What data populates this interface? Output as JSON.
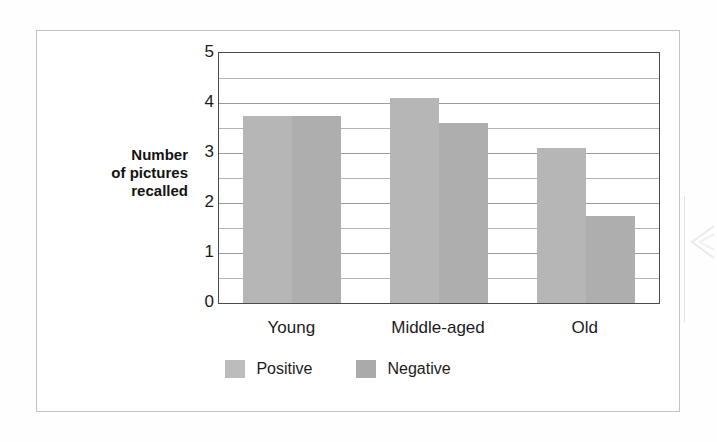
{
  "chart_data": {
    "type": "bar",
    "title": "",
    "subtitle": "",
    "xlabel": "",
    "ylabel": "Number of pictures recalled",
    "ylabel_lines": [
      "Number",
      "of pictures",
      "recalled"
    ],
    "categories": [
      "Young",
      "Middle-aged",
      "Old"
    ],
    "series": [
      {
        "name": "Positive",
        "color": "#b6b6b6",
        "values": [
          3.75,
          4.1,
          3.1
        ]
      },
      {
        "name": "Negative",
        "color": "#aeaeae",
        "values": [
          3.75,
          3.6,
          1.75
        ]
      }
    ],
    "ylim": [
      0,
      5
    ],
    "ytick_labels": [
      "0",
      "1",
      "2",
      "3",
      "4",
      "5"
    ],
    "ytick_values": [
      0,
      1,
      2,
      3,
      4,
      5
    ],
    "gridline_values": [
      0.5,
      1,
      1.5,
      2,
      2.5,
      3,
      3.5,
      4,
      4.5
    ],
    "grid": true,
    "legend_position": "bottom",
    "legend_entries": [
      "Positive",
      "Negative"
    ]
  },
  "legend": {
    "positive_label": "Positive",
    "negative_label": "Negative"
  },
  "axis": {
    "y_label_line1": "Number",
    "y_label_line2": "of pictures",
    "y_label_line3": "recalled",
    "tick_5": "5",
    "tick_4": "4",
    "tick_3": "3",
    "tick_2": "2",
    "tick_1": "1",
    "tick_0": "0"
  },
  "categories": {
    "young": "Young",
    "middle_aged": "Middle-aged",
    "old": "Old"
  },
  "colors": {
    "positive_bar": "#b6b6b6",
    "negative_bar": "#aeaeae",
    "axis_line": "#4a4a4a",
    "gridline": "#9a9a9a",
    "frame": "#c3c3c3",
    "text": "#1a1a1a"
  }
}
